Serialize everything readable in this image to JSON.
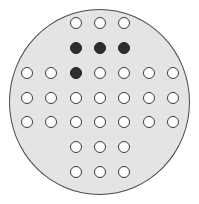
{
  "game": {
    "name": "peg-solitaire",
    "board_shape": "circle",
    "colors": {
      "board": "#e4e4e4",
      "empty_hole": "#ffffff",
      "peg": "#2e2e2e",
      "outline": "#3a3a3a"
    },
    "columns_x": [
      27,
      51,
      76,
      100,
      124,
      149,
      173
    ],
    "rows_y": [
      23,
      48,
      73,
      98,
      122,
      147,
      172
    ],
    "grid": [
      [
        null,
        null,
        0,
        0,
        0,
        null,
        null
      ],
      [
        null,
        null,
        1,
        1,
        1,
        null,
        null
      ],
      [
        0,
        0,
        1,
        0,
        0,
        0,
        0
      ],
      [
        0,
        0,
        0,
        0,
        0,
        0,
        0
      ],
      [
        0,
        0,
        0,
        0,
        0,
        0,
        0
      ],
      [
        null,
        null,
        0,
        0,
        0,
        null,
        null
      ],
      [
        null,
        null,
        0,
        0,
        0,
        null,
        null
      ]
    ],
    "peg_count": 4,
    "hole_count": 33
  }
}
